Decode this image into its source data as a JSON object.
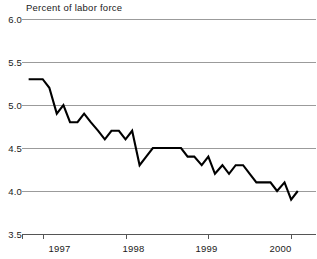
{
  "chart_data": {
    "type": "line",
    "title": "Percent of labor force",
    "xlabel": "",
    "ylabel": "Percent of labor force",
    "ylim": [
      3.5,
      6.0
    ],
    "yticks": [
      6.0,
      5.5,
      5.0,
      4.5,
      4.0,
      3.5
    ],
    "ytick_labels": [
      "6.0",
      "5.5",
      "5.0",
      "4.5",
      "4.0",
      "3.5"
    ],
    "xlim": [
      1996.75,
      2000.3
    ],
    "xticks": [
      1997.0,
      1998.0,
      1999.0,
      2000.0
    ],
    "xtick_labels": [
      "1997",
      "1998",
      "1999",
      "2000"
    ],
    "grid": "horizontal",
    "legend": "none",
    "series": [
      {
        "name": "Unemployment rate",
        "color": "#000000",
        "x": [
          1996.83,
          1996.92,
          1997.0,
          1997.08,
          1997.17,
          1997.25,
          1997.33,
          1997.42,
          1997.5,
          1997.58,
          1997.67,
          1997.75,
          1997.83,
          1997.92,
          1998.0,
          1998.08,
          1998.17,
          1998.25,
          1998.33,
          1998.42,
          1998.5,
          1998.58,
          1998.67,
          1998.75,
          1998.83,
          1998.92,
          1999.0,
          1999.08,
          1999.17,
          1999.25,
          1999.33,
          1999.42,
          1999.5,
          1999.58,
          1999.67,
          1999.75,
          1999.83,
          1999.92,
          2000.0,
          2000.08
        ],
        "values": [
          5.3,
          5.3,
          5.3,
          5.2,
          4.9,
          5.0,
          4.8,
          4.8,
          4.9,
          4.8,
          4.7,
          4.6,
          4.7,
          4.7,
          4.6,
          4.7,
          4.3,
          4.4,
          4.5,
          4.5,
          4.5,
          4.5,
          4.5,
          4.4,
          4.4,
          4.3,
          4.4,
          4.2,
          4.3,
          4.2,
          4.3,
          4.3,
          4.2,
          4.1,
          4.1,
          4.1,
          4.0,
          4.1,
          3.9,
          4.0
        ]
      }
    ]
  },
  "axis": {
    "title": "Percent of labor force",
    "y_labels": [
      "6.0",
      "5.5",
      "5.0",
      "4.5",
      "4.0",
      "3.5"
    ],
    "x_labels": [
      "1997",
      "1998",
      "1999",
      "2000"
    ]
  }
}
